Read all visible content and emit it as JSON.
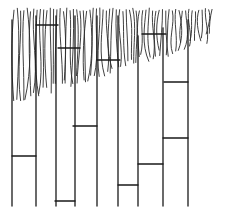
{
  "diagram": {
    "colors": {
      "ink": "#1a1a1a",
      "background": "#ffffff"
    },
    "stems_x": [
      12,
      36,
      56,
      75,
      97,
      118,
      138,
      163,
      188
    ],
    "stem_bottom_y": 206,
    "rungs": [
      {
        "x1": 36,
        "x2": 58,
        "y": 25
      },
      {
        "x1": 58,
        "x2": 80,
        "y": 48
      },
      {
        "x1": 97,
        "x2": 120,
        "y": 60
      },
      {
        "x1": 142,
        "x2": 166,
        "y": 34
      },
      {
        "x1": 164,
        "x2": 188,
        "y": 82
      },
      {
        "x1": 73,
        "x2": 97,
        "y": 126
      },
      {
        "x1": 163,
        "x2": 188,
        "y": 138
      },
      {
        "x1": 12,
        "x2": 36,
        "y": 156
      },
      {
        "x1": 138,
        "x2": 163,
        "y": 164
      },
      {
        "x1": 118,
        "x2": 138,
        "y": 185
      },
      {
        "x1": 55,
        "x2": 75,
        "y": 201
      }
    ],
    "strand_region": {
      "top_y": 6,
      "left_end_y": 110,
      "right_end_y": 38
    }
  }
}
